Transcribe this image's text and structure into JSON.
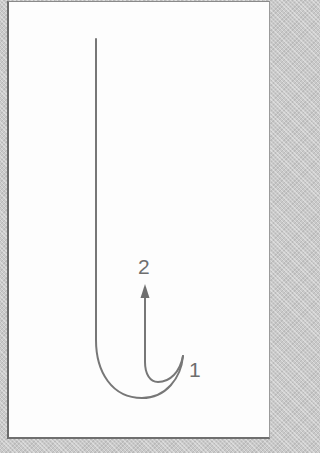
{
  "diagram": {
    "labels": {
      "point_1": "1",
      "point_2": "2"
    },
    "colors": {
      "stroke": "#777777",
      "label": "#6e6e6e",
      "frame_border": "#6b6b6b",
      "background": "#fdfdfd",
      "margin": "#c9c9c9"
    },
    "icons": {
      "arrowhead": "arrow-up-icon"
    }
  }
}
